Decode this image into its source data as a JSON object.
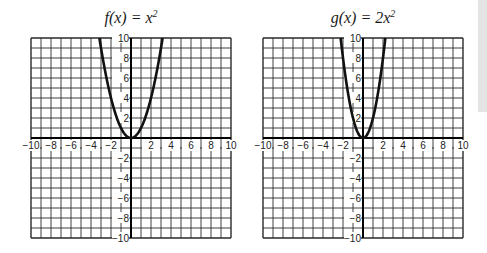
{
  "chart_data": [
    {
      "type": "line",
      "title": "f(x) = x²",
      "title_parts": {
        "fn": "f",
        "arg": "(x) = x",
        "exp": "2"
      },
      "function": "x^2",
      "coefficient": 1,
      "xlim": [
        -10,
        10
      ],
      "ylim": [
        -10,
        10
      ],
      "grid": true,
      "grid_step": 1,
      "x_tick_labels": [
        "−10",
        "−8",
        "−6",
        "−4",
        "−2",
        "2",
        "4",
        "6",
        "8",
        "10"
      ],
      "y_tick_labels": [
        "10",
        "8",
        "6",
        "4",
        "2",
        "−2",
        "−4",
        "−6",
        "−8",
        "−10"
      ],
      "series": [
        {
          "name": "f(x)",
          "x": [
            -3.16,
            -3,
            -2,
            -1,
            0,
            1,
            2,
            3,
            3.16
          ],
          "y": [
            10,
            9,
            4,
            1,
            0,
            1,
            4,
            9,
            10
          ]
        }
      ]
    },
    {
      "type": "line",
      "title": "g(x) = 2x²",
      "title_parts": {
        "fn": "g",
        "arg": "(x) = 2x",
        "exp": "2"
      },
      "function": "2x^2",
      "coefficient": 2,
      "xlim": [
        -10,
        10
      ],
      "ylim": [
        -10,
        10
      ],
      "grid": true,
      "grid_step": 1,
      "x_tick_labels": [
        "−10",
        "−8",
        "−6",
        "−4",
        "−2",
        "2",
        "4",
        "6",
        "8",
        "10"
      ],
      "y_tick_labels": [
        "10",
        "8",
        "6",
        "4",
        "2",
        "−2",
        "−4",
        "−6",
        "−8",
        "−10"
      ],
      "series": [
        {
          "name": "g(x)",
          "x": [
            -2.24,
            -2,
            -1,
            0,
            1,
            2,
            2.24
          ],
          "y": [
            10,
            8,
            2,
            0,
            2,
            8,
            10
          ]
        }
      ]
    }
  ],
  "style": {
    "grid_color": "#2a2a2a",
    "curve_color": "#111111",
    "background": "#ffffff"
  }
}
